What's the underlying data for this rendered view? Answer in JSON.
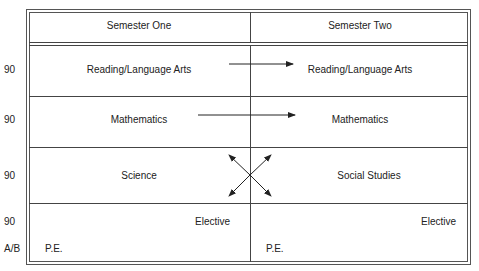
{
  "header": {
    "col1": "Semester One",
    "col2": "Semester Two"
  },
  "rows": [
    {
      "minutes": "90",
      "sem1": "Reading/Language Arts",
      "sem2": "Reading/Language Arts"
    },
    {
      "minutes": "90",
      "sem1": "Mathematics",
      "sem2": "Mathematics"
    },
    {
      "minutes": "90",
      "sem1": "Science",
      "sem2": "Social Studies"
    },
    {
      "minutes": "90",
      "sem1": "Elective",
      "sem2": "Elective"
    },
    {
      "minutes": "A/B",
      "sem1": "P.E.",
      "sem2": "P.E."
    }
  ],
  "colors": {
    "line": "#444444",
    "text": "#222222"
  }
}
